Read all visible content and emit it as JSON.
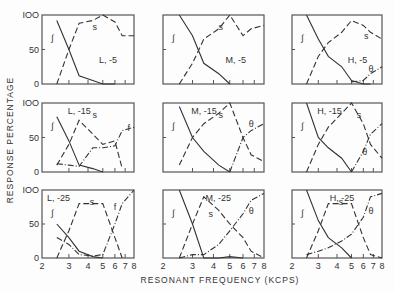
{
  "chart_data": {
    "type": "line",
    "xlabel": "RESONANT FREQUENCY (KCPS)",
    "ylabel": "RESPONSE PERCENTAGE",
    "x_ticks": [
      "2",
      "3",
      "4",
      "5",
      "6",
      "7",
      "8"
    ],
    "x_scale": "log",
    "y_ticks": [
      "0",
      "50",
      "100"
    ],
    "ylim": [
      0,
      100
    ],
    "xlim": [
      2,
      8
    ],
    "x_points": [
      2.5,
      3.0,
      3.5,
      4.3,
      5.0,
      6.0,
      6.7,
      8.0
    ],
    "panels": [
      {
        "label": "L, -5",
        "row": 0,
        "col": 0,
        "series": [
          {
            "name": "ʃ",
            "style": "solid",
            "values": [
              92,
              50,
              12,
              5,
              0,
              0,
              null,
              null
            ]
          },
          {
            "name": "s",
            "style": "dash",
            "values": [
              0,
              50,
              88,
              92,
              100,
              90,
              70,
              70
            ]
          }
        ]
      },
      {
        "label": "M, -5",
        "row": 0,
        "col": 1,
        "series": [
          {
            "name": "ʃ",
            "style": "solid",
            "values": [
              100,
              70,
              30,
              15,
              0,
              null,
              null,
              null
            ]
          },
          {
            "name": "s",
            "style": "dash",
            "values": [
              0,
              30,
              65,
              80,
              100,
              70,
              80,
              85
            ]
          }
        ]
      },
      {
        "label": "H, -5",
        "row": 0,
        "col": 2,
        "series": [
          {
            "name": "ʃ",
            "style": "solid",
            "values": [
              100,
              65,
              40,
              25,
              5,
              0,
              0,
              null
            ]
          },
          {
            "name": "s",
            "style": "dash",
            "values": [
              0,
              40,
              60,
              75,
              92,
              85,
              75,
              65
            ]
          },
          {
            "name": "θ",
            "style": "dashdot",
            "values": [
              null,
              null,
              null,
              null,
              3,
              5,
              15,
              25
            ]
          }
        ]
      },
      {
        "label": "L, -15",
        "row": 1,
        "col": 0,
        "series": [
          {
            "name": "ʃ",
            "style": "solid",
            "values": [
              80,
              45,
              10,
              5,
              0,
              null,
              null,
              null
            ]
          },
          {
            "name": "s",
            "style": "dash",
            "values": [
              10,
              40,
              75,
              55,
              40,
              45,
              5,
              null
            ]
          },
          {
            "name": "f",
            "style": "dashdot",
            "values": [
              12,
              10,
              8,
              35,
              35,
              38,
              60,
              65
            ]
          }
        ]
      },
      {
        "label": "M, -15",
        "row": 1,
        "col": 1,
        "series": [
          {
            "name": "ʃ",
            "style": "solid",
            "values": [
              95,
              50,
              30,
              10,
              0,
              null,
              null,
              null
            ]
          },
          {
            "name": "s",
            "style": "dash",
            "values": [
              10,
              50,
              70,
              85,
              100,
              50,
              25,
              15
            ]
          },
          {
            "name": "θ",
            "style": "dashdot",
            "values": [
              null,
              null,
              null,
              null,
              0,
              50,
              60,
              70
            ]
          }
        ]
      },
      {
        "label": "H, -15",
        "row": 1,
        "col": 2,
        "series": [
          {
            "name": "ʃ",
            "style": "solid",
            "values": [
              100,
              50,
              35,
              20,
              0,
              null,
              null,
              null
            ]
          },
          {
            "name": "s",
            "style": "dash",
            "values": [
              0,
              40,
              65,
              85,
              100,
              70,
              40,
              20
            ]
          },
          {
            "name": "θ",
            "style": "dashdot",
            "values": [
              null,
              null,
              null,
              null,
              0,
              30,
              55,
              70
            ]
          }
        ]
      },
      {
        "label": "L, -25",
        "row": 2,
        "col": 0,
        "series": [
          {
            "name": "ʃ",
            "style": "solid",
            "values": [
              50,
              30,
              10,
              2,
              0,
              null,
              null,
              null
            ]
          },
          {
            "name": "s",
            "style": "dash",
            "values": [
              0,
              40,
              80,
              80,
              80,
              30,
              0,
              null
            ]
          },
          {
            "name": "f",
            "style": "dashdot",
            "values": [
              30,
              20,
              5,
              3,
              5,
              50,
              80,
              100
            ]
          }
        ]
      },
      {
        "label": "M, -25",
        "row": 2,
        "col": 1,
        "series": [
          {
            "name": "ʃ",
            "style": "solid",
            "values": [
              100,
              50,
              0,
              0,
              2,
              0,
              null,
              null
            ]
          },
          {
            "name": "s",
            "style": "dash",
            "values": [
              0,
              50,
              90,
              70,
              50,
              30,
              10,
              0
            ]
          },
          {
            "name": "θ",
            "style": "dashdot",
            "values": [
              0,
              5,
              5,
              20,
              40,
              65,
              85,
              95
            ]
          }
        ]
      },
      {
        "label": "H, -25",
        "row": 2,
        "col": 2,
        "series": [
          {
            "name": "ʃ",
            "style": "solid",
            "values": [
              100,
              55,
              30,
              15,
              0,
              null,
              null,
              null
            ]
          },
          {
            "name": "s",
            "style": "dash",
            "values": [
              0,
              40,
              80,
              80,
              80,
              30,
              5,
              0
            ]
          },
          {
            "name": "θ",
            "style": "dashdot",
            "values": [
              5,
              10,
              15,
              25,
              35,
              60,
              90,
              95
            ]
          }
        ]
      }
    ]
  }
}
